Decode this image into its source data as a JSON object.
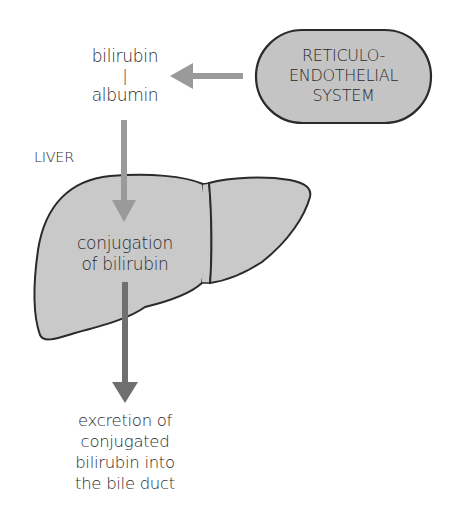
{
  "diagram": {
    "source_label": {
      "line1": "bilirubin",
      "connector": "|",
      "line2": "albumin"
    },
    "res_node": {
      "line1": "RETICULO-",
      "line2": "ENDOTHELIAL",
      "line3": "SYSTEM",
      "fill": "#c4c4c4"
    },
    "organ_label": "LIVER",
    "organ_process": {
      "line1": "conjugation",
      "line2": "of bilirubin",
      "fill": "#c9c9c9"
    },
    "output_label": {
      "line1": "excretion of",
      "line2": "conjugated",
      "line3": "bilirubin into",
      "line4": "the bile duct"
    },
    "colors": {
      "arrow_light": "#9a9a9a",
      "arrow_dark": "#6f6f6f",
      "outline": "#2a2a2a"
    },
    "edges": [
      {
        "from": "res_node",
        "to": "source_label",
        "style": "light"
      },
      {
        "from": "source_label",
        "to": "organ_process",
        "style": "light"
      },
      {
        "from": "organ_process",
        "to": "output_label",
        "style": "dark"
      }
    ]
  }
}
